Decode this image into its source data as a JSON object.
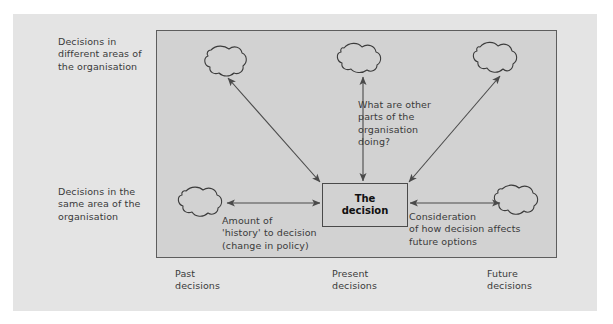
{
  "figure": {
    "background_color": "#e4e4e4",
    "field_color": "#d2d2d2",
    "line_color": "#4a4a4a",
    "text_color": "#3a3a3a"
  },
  "side_labels": {
    "different_areas": "Decisions in\ndifferent areas of\nthe organisation",
    "same_area": "Decisions in the\nsame area of the\norganisation"
  },
  "center": {
    "decision_label": "The\ndecision"
  },
  "notes": {
    "other_parts": "What are other\nparts of the\norganisation\ndoing?",
    "history": "Amount of\n'history' to decision\n(change in policy)",
    "consideration": "Consideration\nof how decision affects\nfuture options"
  },
  "axis_labels": {
    "past": "Past\ndecisions",
    "present": "Present\ndecisions",
    "future": "Future\ndecisions"
  },
  "nodes": [
    {
      "name": "cloud-top-left",
      "label": ""
    },
    {
      "name": "cloud-top-center",
      "label": ""
    },
    {
      "name": "cloud-top-right",
      "label": ""
    },
    {
      "name": "cloud-mid-left",
      "label": ""
    },
    {
      "name": "cloud-mid-right",
      "label": ""
    }
  ]
}
